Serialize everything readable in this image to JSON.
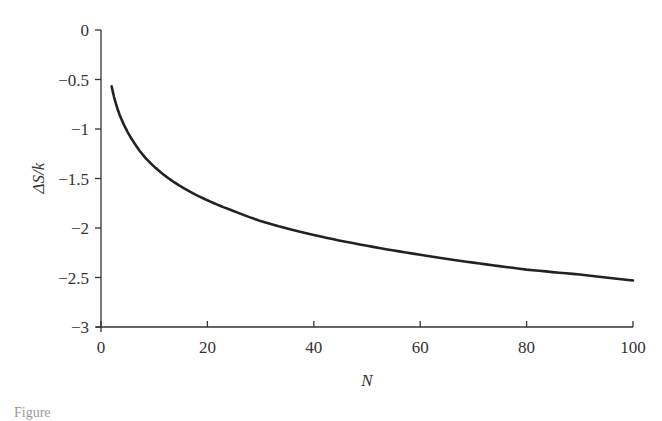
{
  "chart_data": {
    "type": "line",
    "title": "",
    "xlabel": "N",
    "ylabel": "ΔS/k",
    "xlim": [
      0,
      100
    ],
    "ylim": [
      -3,
      0
    ],
    "x_ticks": [
      0,
      20,
      40,
      60,
      80,
      100
    ],
    "x_tick_labels": [
      "0",
      "20",
      "40",
      "60",
      "80",
      "100"
    ],
    "y_ticks": [
      0,
      -0.5,
      -1,
      -1.5,
      -2,
      -2.5,
      -3
    ],
    "y_tick_labels": [
      "0",
      "−0.5",
      "−1",
      "−1.5",
      "−2",
      "−2.5",
      "−3"
    ],
    "grid": false,
    "legend": null,
    "series": [
      {
        "name": "ΔS/k",
        "color": "#222222",
        "x": [
          2,
          3,
          4,
          5,
          6,
          8,
          10,
          12,
          15,
          20,
          25,
          30,
          40,
          50,
          60,
          70,
          80,
          90,
          100
        ],
        "values": [
          -0.57,
          -0.78,
          -0.92,
          -1.03,
          -1.12,
          -1.27,
          -1.38,
          -1.47,
          -1.58,
          -1.72,
          -1.83,
          -1.93,
          -2.07,
          -2.18,
          -2.27,
          -2.35,
          -2.42,
          -2.47,
          -2.53
        ]
      }
    ]
  },
  "caption": "Figure"
}
